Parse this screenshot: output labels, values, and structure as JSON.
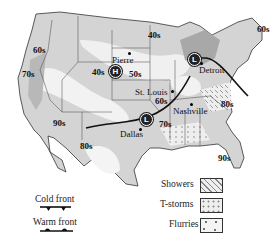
{
  "map": {
    "title": "",
    "region": "United States weather map",
    "colors": {
      "land": "#d4d4d4",
      "land_light": "#f2f2f2",
      "land_dark": "#a8a8a8",
      "border": "#333333",
      "front": "#111111",
      "background": "#ffffff"
    },
    "temperature_labels": [
      {
        "id": "t60-nw",
        "text": "60s"
      },
      {
        "id": "t70-w",
        "text": "70s"
      },
      {
        "id": "t40-rockies",
        "text": "40s"
      },
      {
        "id": "t50-plains",
        "text": "50s"
      },
      {
        "id": "t40-north",
        "text": "40s"
      },
      {
        "id": "t60-ne",
        "text": "60s"
      },
      {
        "id": "t60-stlouis",
        "text": "60s"
      },
      {
        "id": "t80-se",
        "text": "80s"
      },
      {
        "id": "t70-south",
        "text": "70s"
      },
      {
        "id": "t90-sw",
        "text": "90s"
      },
      {
        "id": "t80-texas",
        "text": "80s"
      },
      {
        "id": "t90-fl",
        "text": "90s"
      }
    ],
    "cities": [
      {
        "id": "pierre",
        "name": "Pierre"
      },
      {
        "id": "stlouis",
        "name": "St. Louis"
      },
      {
        "id": "detroit",
        "name": "Detroit"
      },
      {
        "id": "nashville",
        "name": "Nashville"
      },
      {
        "id": "dallas",
        "name": "Dallas"
      }
    ],
    "pressure_centers": [
      {
        "id": "high-pierre",
        "symbol": "H",
        "type": "high"
      },
      {
        "id": "low-detroit",
        "symbol": "L",
        "type": "low"
      },
      {
        "id": "low-south",
        "symbol": "L",
        "type": "low"
      }
    ]
  },
  "legend": {
    "fronts": [
      {
        "id": "cold",
        "label": "Cold front"
      },
      {
        "id": "warm",
        "label": "Warm front"
      }
    ],
    "precipitation": [
      {
        "id": "showers",
        "label": "Showers"
      },
      {
        "id": "tstorms",
        "label": "T-storms"
      },
      {
        "id": "flurries",
        "label": "Flurries"
      }
    ]
  }
}
